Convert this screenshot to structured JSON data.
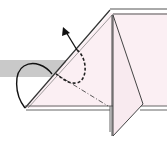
{
  "diagram": {
    "type": "origami-fold-step",
    "colors": {
      "paper": "#fbeff3",
      "paper_flap": "#f8eaef",
      "band": "#c8c8c8",
      "line": "#333333",
      "arrow": "#111111"
    },
    "elements": [
      "gray-band",
      "paper-body",
      "vertical-flap",
      "valley-fold-line",
      "dashed-curve-path",
      "fold-arrow",
      "loop-arrow"
    ]
  }
}
